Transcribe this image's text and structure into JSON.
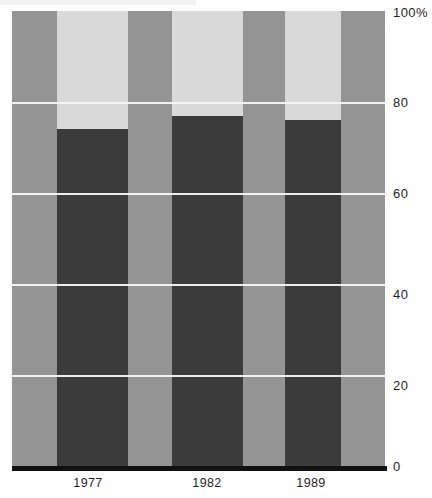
{
  "chart_data": {
    "type": "bar",
    "title": "",
    "subtitle": "",
    "xlabel": "",
    "ylabel": "",
    "ylim": [
      0,
      100
    ],
    "yticks": [
      0,
      20,
      40,
      60,
      80,
      100
    ],
    "ytick_labels": [
      "0",
      "20",
      "40",
      "60",
      "80",
      "100%"
    ],
    "categories": [
      "1977",
      "1982",
      "1989"
    ],
    "grid": true,
    "legend": "none",
    "series": [
      {
        "name": "dark-segment",
        "color": "#3b3b3b",
        "values": [
          74,
          77,
          76
        ]
      },
      {
        "name": "light-segment",
        "color": "#d9d9d9",
        "values": [
          26,
          23,
          24
        ]
      }
    ],
    "background_bands_color": "#949494",
    "gridline_color": "#f7f7f7",
    "axis_color": "#111111"
  },
  "axes": {
    "y_ticks": [
      {
        "label": "100%",
        "value": 100
      },
      {
        "label": "80",
        "value": 80
      },
      {
        "label": "60",
        "value": 60
      },
      {
        "label": "40",
        "value": 40
      },
      {
        "label": "20",
        "value": 20
      },
      {
        "label": "0",
        "value": 0
      }
    ],
    "x_ticks": [
      {
        "label": "1977",
        "center_pct": 24.8
      },
      {
        "label": "1982",
        "center_pct": 55.5
      },
      {
        "label": "1989",
        "center_pct": 83.9
      }
    ]
  }
}
